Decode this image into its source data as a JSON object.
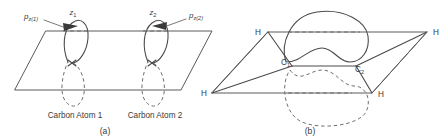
{
  "figure": {
    "line_color": "#5a5a5a",
    "text_color": "#3a3a3a",
    "background": "#ffffff"
  },
  "panel_a": {
    "caption": "(a)",
    "axis_label_left": "z",
    "axis_label_left_sub": "1",
    "axis_label_right": "z",
    "axis_label_right_sub": "2",
    "orbital_label_left": "p",
    "orbital_label_left_sub": "z(1)",
    "orbital_label_right": "p",
    "orbital_label_right_sub": "z(2)",
    "atom_label_left": "Carbon Atom 1",
    "atom_label_right": "Carbon Atom 2"
  },
  "panel_b": {
    "caption": "(b)",
    "hydrogen_top_left": "H",
    "hydrogen_top_right": "H",
    "hydrogen_bottom_left": "H",
    "hydrogen_bottom_right": "H",
    "carbon_left": "C",
    "carbon_left_sub": "1",
    "carbon_right": "C",
    "carbon_right_sub": "2"
  }
}
